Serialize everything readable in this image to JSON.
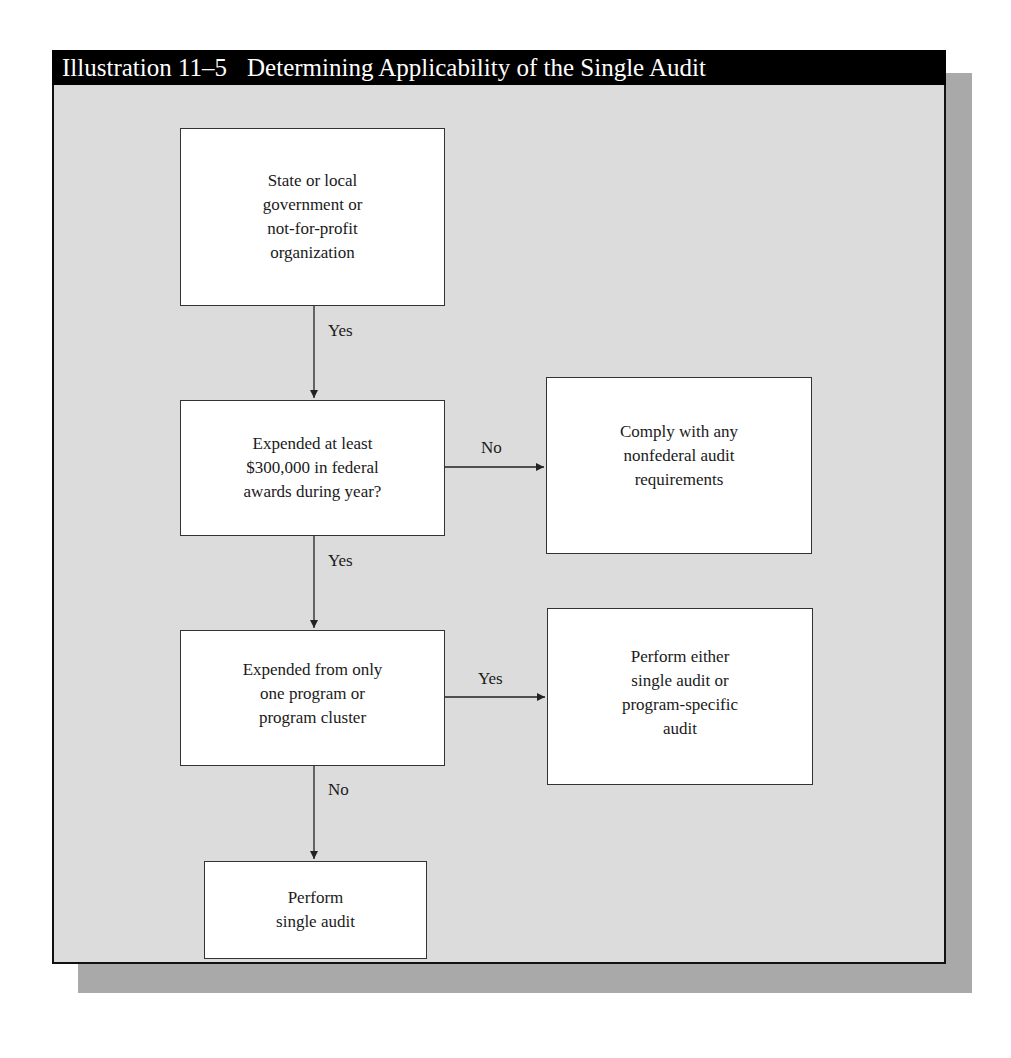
{
  "figure": {
    "label": "Illustration 11–5",
    "title": "Determining Applicability of the Single Audit"
  },
  "nodes": [
    {
      "id": "entity",
      "lines": [
        "State or local",
        "government or",
        "not-for-profit",
        "organization"
      ]
    },
    {
      "id": "expended-300k",
      "lines": [
        "Expended at least",
        "$300,000 in federal",
        "awards during year?"
      ]
    },
    {
      "id": "nonfederal",
      "lines": [
        "Comply with any",
        "nonfederal audit",
        "requirements"
      ]
    },
    {
      "id": "one-program",
      "lines": [
        "Expended from only",
        "one program or",
        "program cluster"
      ]
    },
    {
      "id": "either-audit",
      "lines": [
        "Perform either",
        "single audit or",
        "program-specific",
        "audit"
      ]
    },
    {
      "id": "single-audit",
      "lines": [
        "Perform",
        "single audit"
      ]
    }
  ],
  "edges": [
    {
      "from": "entity",
      "to": "expended-300k",
      "label": "Yes"
    },
    {
      "from": "expended-300k",
      "to": "nonfederal",
      "label": "No"
    },
    {
      "from": "expended-300k",
      "to": "one-program",
      "label": "Yes"
    },
    {
      "from": "one-program",
      "to": "either-audit",
      "label": "Yes"
    },
    {
      "from": "one-program",
      "to": "single-audit",
      "label": "No"
    }
  ],
  "colors": {
    "title_bar": "#000000",
    "title_text": "#ffffff",
    "panel_bg": "#dcdcdc",
    "shadow": "#a9a9a9",
    "node_bg": "#ffffff",
    "line": "#222222"
  }
}
